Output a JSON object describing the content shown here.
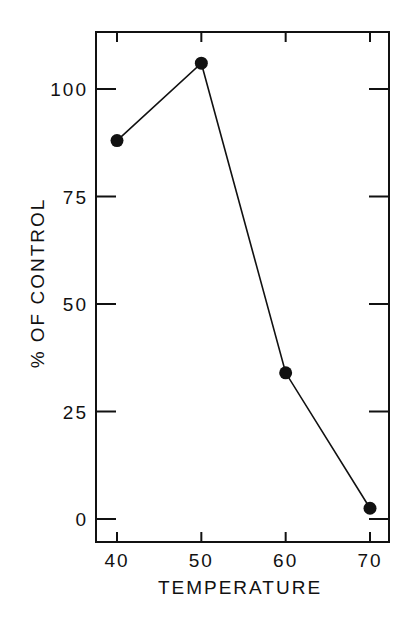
{
  "chart_data": {
    "type": "line",
    "title": "",
    "xlabel": "TEMPERATURE",
    "ylabel": "% OF CONTROL",
    "x": [
      40,
      50,
      60,
      70
    ],
    "series": [
      {
        "name": "% of control",
        "values": [
          88,
          106,
          34,
          2.5
        ],
        "marker": "filled-circle",
        "color": "#111111"
      }
    ],
    "xticks": [
      "40",
      "50",
      "60",
      "70"
    ],
    "yticks": [
      "0",
      "25",
      "50",
      "75",
      "100"
    ],
    "xlim": [
      37.5,
      72.5
    ],
    "ylim": [
      -5,
      113
    ],
    "grid": false,
    "legend": "none"
  }
}
